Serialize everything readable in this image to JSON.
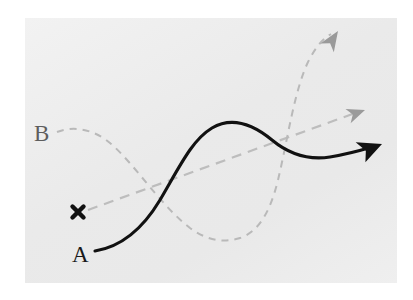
{
  "figure": {
    "type": "schematic-diagram",
    "title": "",
    "background_color": "#ffffff",
    "panel_color": "#ececec",
    "panel": {
      "x": 25,
      "y": 18,
      "width": 372,
      "height": 265
    }
  },
  "labels": {
    "a": "A",
    "b": "B"
  },
  "colors": {
    "solid_path": "#111111",
    "dashed_path": "#b9b9b9",
    "straight_dashed": "#bdbdbd",
    "marker": "#111111",
    "label_a": "#1a1a1a",
    "label_b": "#5d5d5d"
  },
  "elements": [
    {
      "id": "path-a",
      "name": "solid-black-curve",
      "label": "A",
      "style": "solid",
      "color": "#111111",
      "stroke_width": 3.1,
      "arrowhead": "solid-filled",
      "start_point": [
        95,
        251
      ],
      "end_point": [
        381,
        145
      ],
      "peak_point": [
        230,
        125
      ],
      "path": "M 95 251 C 120 247 142 230 160 200 C 180 166 192 140 212 128 C 234 115 255 126 272 140 C 290 155 310 160 330 157 C 348 154 362 150 372 147"
    },
    {
      "id": "path-b",
      "name": "dashed-gray-curve",
      "label": "B",
      "style": "dashed",
      "color": "#b9b9b9",
      "stroke_width": 2.0,
      "dash_pattern": "7 6",
      "arrowhead": "open-filled-gray",
      "start_point": [
        57,
        132
      ],
      "end_point": [
        337,
        32
      ],
      "trough_point": [
        230,
        238
      ],
      "path": "M 57 132 C 72 126 92 128 110 143 C 134 163 160 205 190 228 C 208 241 224 243 240 238 C 258 232 270 213 278 180 C 288 138 294 92 308 62 C 316 46 324 38 331 34"
    },
    {
      "id": "path-straight",
      "name": "straight-dashed-trend-line",
      "style": "dashed",
      "color": "#bdbdbd",
      "stroke_width": 2.2,
      "dash_pattern": "10 7",
      "arrowhead": "open-filled-gray",
      "start_point": [
        88,
        210
      ],
      "end_point": [
        365,
        110
      ],
      "path": "M 88 210 L 358 112"
    },
    {
      "id": "marker-x",
      "name": "x-marker",
      "style": "cross",
      "color": "#111111",
      "center": [
        78,
        212
      ],
      "size": 13
    }
  ],
  "arrowheads": [
    {
      "id": "arrow-a",
      "belongs_to": "path-a",
      "tip": [
        381,
        145
      ],
      "angle_deg": -20,
      "fill": "#111111"
    },
    {
      "id": "arrow-b",
      "belongs_to": "path-b",
      "tip": [
        337,
        32
      ],
      "angle_deg": -58,
      "fill": "#9a9a9a"
    },
    {
      "id": "arrow-st",
      "belongs_to": "path-straight",
      "tip": [
        365,
        110
      ],
      "angle_deg": -20,
      "fill": "#9a9a9a"
    }
  ]
}
